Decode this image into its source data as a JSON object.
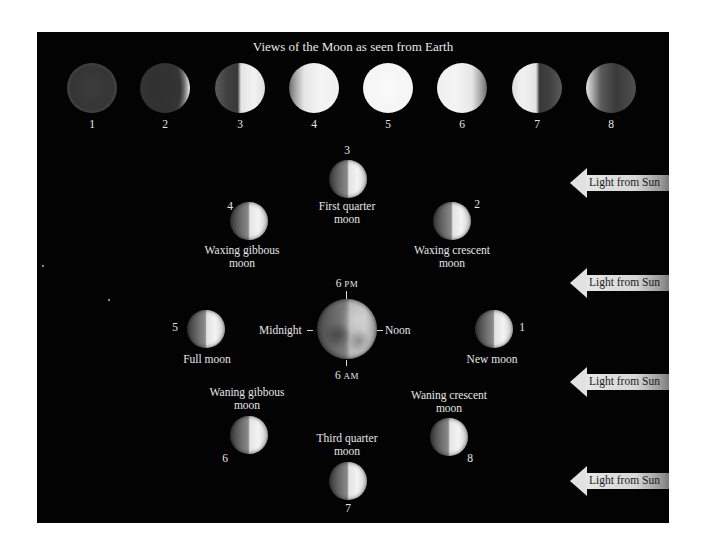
{
  "diagram": {
    "title": "Views of the Moon as seen from Earth",
    "top_row": [
      {
        "number": "1",
        "phase": "new"
      },
      {
        "number": "2",
        "phase": "waxing-crescent"
      },
      {
        "number": "3",
        "phase": "first-quarter"
      },
      {
        "number": "4",
        "phase": "waxing-gibbous"
      },
      {
        "number": "5",
        "phase": "full"
      },
      {
        "number": "6",
        "phase": "waning-gibbous"
      },
      {
        "number": "7",
        "phase": "third-quarter"
      },
      {
        "number": "8",
        "phase": "waning-crescent"
      }
    ],
    "orbit": {
      "moons": [
        {
          "number": "1",
          "label_line1": "New moon",
          "label_line2": ""
        },
        {
          "number": "2",
          "label_line1": "Waxing crescent",
          "label_line2": "moon"
        },
        {
          "number": "3",
          "label_line1": "First quarter",
          "label_line2": "moon"
        },
        {
          "number": "4",
          "label_line1": "Waxing gibbous",
          "label_line2": "moon"
        },
        {
          "number": "5",
          "label_line1": "Full moon",
          "label_line2": ""
        },
        {
          "number": "6",
          "label_line1": "Waning gibbous",
          "label_line2": "moon"
        },
        {
          "number": "7",
          "label_line1": "Third quarter",
          "label_line2": "moon"
        },
        {
          "number": "8",
          "label_line1": "Waning crescent",
          "label_line2": "moon"
        }
      ],
      "earth": {
        "top_time_num": "6",
        "top_time_suffix": "PM",
        "bottom_time_num": "6",
        "bottom_time_suffix": "AM",
        "left_label": "Midnight",
        "right_label": "Noon"
      }
    },
    "sun_arrows": [
      {
        "label": "Light from Sun"
      },
      {
        "label": "Light from Sun"
      },
      {
        "label": "Light from Sun"
      },
      {
        "label": "Light from Sun"
      }
    ],
    "colors": {
      "background": "#030303",
      "text": "#e6e6e6",
      "arrow": "#e2e2e2"
    }
  }
}
